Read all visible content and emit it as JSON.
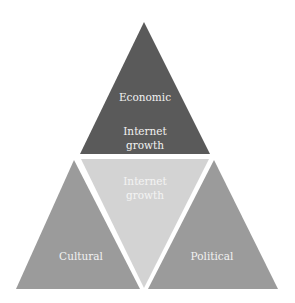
{
  "diagram": {
    "type": "triangle-pyramid",
    "colors": {
      "top": "#5a5a5a",
      "middle": "#d3d3d3",
      "left": "#9b9b9b",
      "right": "#9b9b9b",
      "background": "#ffffff"
    },
    "top": {
      "label": "Economic",
      "sublabel_line1": "Internet",
      "sublabel_line2": "growth"
    },
    "middle": {
      "label_line1": "Internet",
      "label_line2": "growth"
    },
    "left": {
      "label": "Cultural"
    },
    "right": {
      "label": "Political"
    }
  }
}
